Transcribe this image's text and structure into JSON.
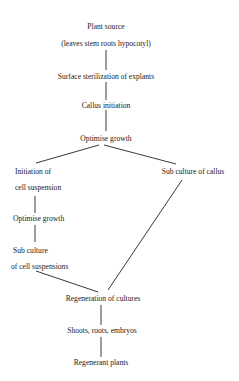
{
  "nodes": {
    "plant_source": {
      "line1": "Plant source",
      "line2": "(leaves stem roots hypocotyl)"
    },
    "surface_sterilization": {
      "line1": "Surface sterilization of explants"
    },
    "callus_initiation": {
      "line1": "Callus initiation"
    },
    "optimise_growth_1": {
      "line1": "Optimise growth"
    },
    "initiation_cell_suspension": {
      "line1": "Initiation of",
      "line2": "cell suspension"
    },
    "sub_culture_callus": {
      "line1": "Sub culture of callus"
    },
    "optimise_growth_2": {
      "line1": "Optimise growth"
    },
    "sub_culture_cell_suspensions": {
      "line1": "Sub culture",
      "line2": "of cell suspensions"
    },
    "regeneration_cultures": {
      "line1": "Regeneration of cultures"
    },
    "shoots_roots_embryos": {
      "line1": "Shoots, roots, embryos"
    },
    "regenerant_plants": {
      "line1": "Regenerant plants"
    }
  },
  "edges": [
    {
      "from": "plant_source",
      "to": "surface_sterilization"
    },
    {
      "from": "surface_sterilization",
      "to": "callus_initiation"
    },
    {
      "from": "callus_initiation",
      "to": "optimise_growth_1"
    },
    {
      "from": "optimise_growth_1",
      "to": "initiation_cell_suspension"
    },
    {
      "from": "optimise_growth_1",
      "to": "sub_culture_callus"
    },
    {
      "from": "initiation_cell_suspension",
      "to": "optimise_growth_2"
    },
    {
      "from": "optimise_growth_2",
      "to": "sub_culture_cell_suspensions"
    },
    {
      "from": "sub_culture_cell_suspensions",
      "to": "regeneration_cultures"
    },
    {
      "from": "sub_culture_callus",
      "to": "regeneration_cultures"
    },
    {
      "from": "regeneration_cultures",
      "to": "shoots_roots_embryos"
    },
    {
      "from": "shoots_roots_embryos",
      "to": "regenerant_plants"
    }
  ]
}
